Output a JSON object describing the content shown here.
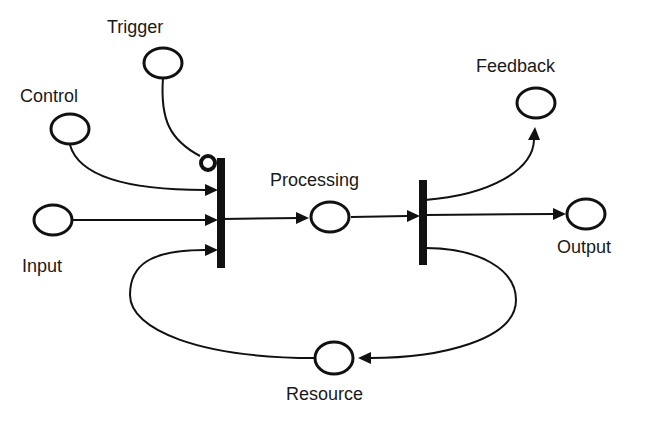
{
  "diagram": {
    "type": "petri-net",
    "places": [
      {
        "id": "trigger",
        "label": "Trigger"
      },
      {
        "id": "control",
        "label": "Control"
      },
      {
        "id": "input",
        "label": "Input"
      },
      {
        "id": "processing",
        "label": "Processing"
      },
      {
        "id": "feedback",
        "label": "Feedback"
      },
      {
        "id": "output",
        "label": "Output"
      },
      {
        "id": "resource",
        "label": "Resource"
      }
    ],
    "transitions": [
      {
        "id": "t1",
        "inputs": [
          "control",
          "input",
          "resource"
        ],
        "inhibitor_inputs": [
          "trigger"
        ],
        "outputs": [
          "processing"
        ]
      },
      {
        "id": "t2",
        "inputs": [
          "processing"
        ],
        "outputs": [
          "feedback",
          "output",
          "resource"
        ]
      }
    ],
    "colors": {
      "stroke": "#111111",
      "background": "#ffffff"
    }
  }
}
